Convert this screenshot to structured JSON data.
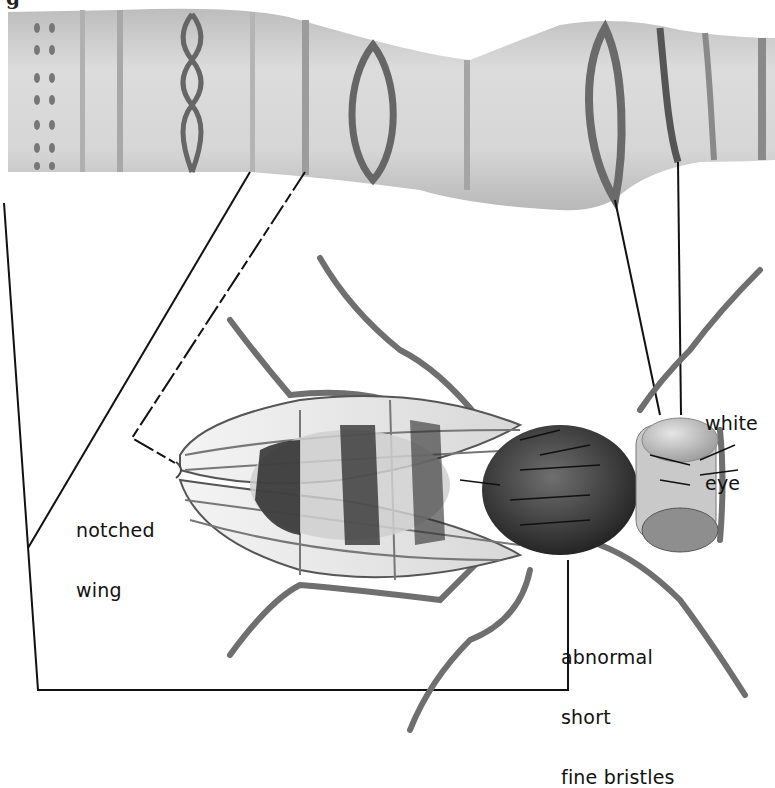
{
  "figure": {
    "caption_fragment": "g",
    "chromosome": {
      "fill": "#cfcfcf",
      "band_color": "#6a6a6a",
      "bands": [
        {
          "type": "beaded-double",
          "x": 40
        },
        {
          "type": "beaded-double",
          "x": 52
        },
        {
          "type": "line",
          "x": 82
        },
        {
          "type": "line",
          "x": 120
        },
        {
          "type": "twisted-chain",
          "x": 192
        },
        {
          "type": "line",
          "x": 252
        },
        {
          "type": "line",
          "x": 305
        },
        {
          "type": "lens",
          "x": 373
        },
        {
          "type": "line",
          "x": 467
        },
        {
          "type": "lens-large",
          "x": 610
        },
        {
          "type": "line",
          "x": 670
        },
        {
          "type": "line",
          "x": 710
        },
        {
          "type": "line",
          "x": 765
        }
      ]
    },
    "labels": {
      "notched_wing": [
        "notched",
        "wing"
      ],
      "white_eye": [
        "white",
        "eye"
      ],
      "bristles": [
        "abnormal",
        "short",
        "fine bristles"
      ]
    },
    "colors": {
      "line": "#111111",
      "fly_dark": "#2a2a2a",
      "fly_mid": "#7a7a7a",
      "wing": "#eeeeee",
      "eye": "#b9b9b9"
    }
  }
}
